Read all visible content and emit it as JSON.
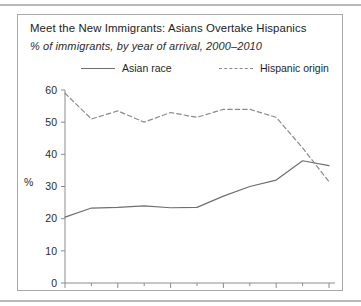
{
  "figure": {
    "title": "Meet the New Immigrants: Asians Overtake Hispanics",
    "subtitle": "% of immigrants, by year of arrival, 2000–2010",
    "y_axis_label": "%"
  },
  "legend": {
    "asian_label": "Asian race",
    "hispanic_label": "Hispanic origin"
  },
  "colors": {
    "asian_line": "#6f6f6f",
    "hispanic_line": "#8a8a8a",
    "axis": "#8c8c8c",
    "panel_border": "#a9a9a9",
    "rule": "#b8b8b8",
    "text": "#222222"
  },
  "axes": {
    "x_ticks_major": [
      "2000",
      "2002",
      "2004",
      "2006",
      "2008",
      "2010"
    ],
    "x_ticks_minor": [
      "2001",
      "2003",
      "2005",
      "2007",
      "2009"
    ],
    "y_ticks": [
      "0",
      "10",
      "20",
      "30",
      "40",
      "50",
      "60"
    ]
  },
  "chart_data": {
    "type": "line",
    "title": "Meet the New Immigrants: Asians Overtake Hispanics",
    "subtitle": "% of immigrants, by year of arrival, 2000–2010",
    "xlabel": "",
    "ylabel": "%",
    "xlim": [
      2000,
      2010
    ],
    "ylim": [
      0,
      60
    ],
    "grid": false,
    "legend_position": "top",
    "x": [
      2000,
      2001,
      2002,
      2003,
      2004,
      2005,
      2006,
      2007,
      2008,
      2009,
      2010
    ],
    "series": [
      {
        "name": "Asian race",
        "style": "solid",
        "color": "#6f6f6f",
        "values": [
          20.5,
          23.3,
          23.5,
          24.0,
          23.4,
          23.5,
          27.0,
          30.0,
          32.0,
          38.0,
          36.5
        ]
      },
      {
        "name": "Hispanic origin",
        "style": "dashed",
        "color": "#8a8a8a",
        "values": [
          59.0,
          51.0,
          53.5,
          50.0,
          53.0,
          51.5,
          54.0,
          54.0,
          51.5,
          42.0,
          31.5
        ]
      }
    ]
  }
}
